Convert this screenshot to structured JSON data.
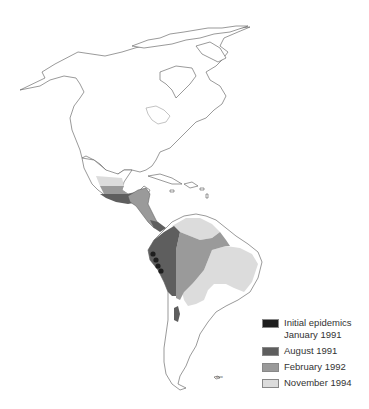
{
  "map": {
    "subject": "Spread of epidemics across the Americas",
    "regions_shown": [
      "North America",
      "Central America",
      "Caribbean",
      "South America"
    ]
  },
  "legend": {
    "items": [
      {
        "label": "Initial epidemics\nJanuary 1991",
        "color": "#1e1e1e"
      },
      {
        "label": "August 1991",
        "color": "#5e5e5e"
      },
      {
        "label": "February 1992",
        "color": "#9a9a9a"
      },
      {
        "label": "November 1994",
        "color": "#dcdcdc"
      }
    ]
  },
  "scale": {
    "label": "ooo"
  },
  "colors": {
    "initial": "#1e1e1e",
    "aug1991": "#5e5e5e",
    "feb1992": "#9a9a9a",
    "nov1994": "#dcdcdc",
    "outline": "#555555"
  }
}
